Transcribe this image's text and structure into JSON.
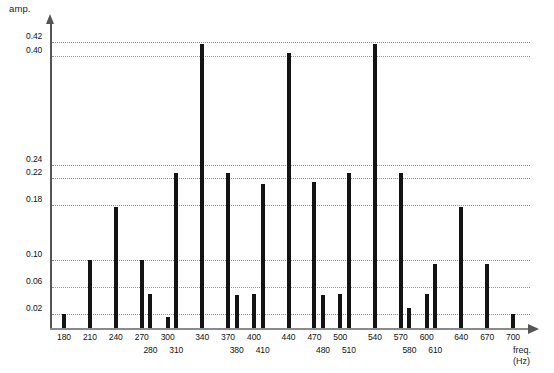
{
  "chart_data": {
    "type": "bar",
    "title": "",
    "subtitle": "",
    "xlabel": "freq.",
    "xunit": "(Hz)",
    "ylabel": "amp.",
    "xlim": [
      170,
      710
    ],
    "ylim": [
      0.0,
      0.44
    ],
    "grid": true,
    "legend": null,
    "categories": [
      180,
      210,
      240,
      270,
      280,
      300,
      310,
      340,
      370,
      380,
      400,
      410,
      440,
      470,
      480,
      500,
      510,
      540,
      570,
      580,
      600,
      610,
      640,
      670,
      700
    ],
    "values": [
      0.021,
      0.1,
      0.178,
      0.1,
      0.05,
      0.016,
      0.228,
      0.417,
      0.228,
      0.048,
      0.05,
      0.212,
      0.404,
      0.215,
      0.048,
      0.05,
      0.228,
      0.417,
      0.228,
      0.03,
      0.05,
      0.094,
      0.178,
      0.094,
      0.02
    ],
    "ytick_values": [
      0.02,
      0.06,
      0.1,
      0.18,
      0.22,
      0.24,
      0.4,
      0.42
    ],
    "ytick_labels": [
      "0.02",
      "0.06",
      "0.10",
      "0.18",
      "0.22",
      "0.24",
      "0.40",
      "0.42"
    ],
    "xtick_labels": [
      "180",
      "210",
      "240",
      "270",
      "280",
      "300",
      "310",
      "340",
      "370",
      "380",
      "400",
      "410",
      "440",
      "470",
      "480",
      "500",
      "510",
      "540",
      "570",
      "580",
      "600",
      "610",
      "640",
      "670",
      "700"
    ],
    "xtick_rows": [
      0,
      0,
      0,
      0,
      1,
      0,
      1,
      0,
      0,
      1,
      0,
      1,
      0,
      0,
      1,
      0,
      1,
      0,
      0,
      1,
      0,
      1,
      0,
      0,
      0
    ],
    "bar_color": "#131313",
    "grid_color": "#8c8c8c",
    "axis_color": "#555555",
    "background": "#ffffff"
  },
  "axes": {
    "amp_title": "amp.",
    "freq_title": "freq.",
    "freq_unit": "(Hz)"
  }
}
